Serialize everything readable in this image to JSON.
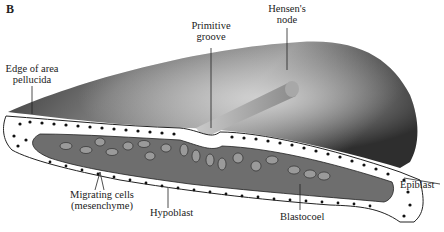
{
  "figure": {
    "panel_letter": "B",
    "labels": {
      "edge_area_pellucida": [
        "Edge of area",
        "pellucida"
      ],
      "primitive_groove": [
        "Primitive",
        "groove"
      ],
      "hensens_node": [
        "Hensen's",
        "node"
      ],
      "epiblast": "Epiblast",
      "migrating_cells": [
        "Migrating cells",
        "(mesenchyme)"
      ],
      "hypoblast": "Hypoblast",
      "blastocoel": "Blastocoel"
    },
    "colors": {
      "surface_dark": "#3a3a3a",
      "surface_light": "#c8c8c8",
      "blastocoel_fill": "#6e6e6e",
      "cell_fill": "#ffffff",
      "mesenchyme_fill": "#9a9a9a",
      "outline": "#222222"
    }
  }
}
